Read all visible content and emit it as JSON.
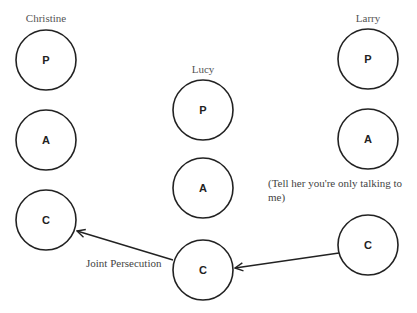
{
  "people": [
    {
      "name": "Christine",
      "states": [
        "P",
        "A",
        "C"
      ]
    },
    {
      "name": "Lucy",
      "states": [
        "P",
        "A",
        "C"
      ]
    },
    {
      "name": "Larry",
      "states": [
        "P",
        "A",
        "C"
      ]
    }
  ],
  "annotations": {
    "larry_note_line1": "(Tell her you're only talking to",
    "larry_note_line2": "me)",
    "lucy_arrow_label": "Joint Persecution"
  },
  "transactions": [
    {
      "from": "Larry.C",
      "to": "Lucy.C"
    },
    {
      "from": "Lucy.C",
      "to": "Christine.C",
      "label": "Joint Persecution"
    }
  ]
}
